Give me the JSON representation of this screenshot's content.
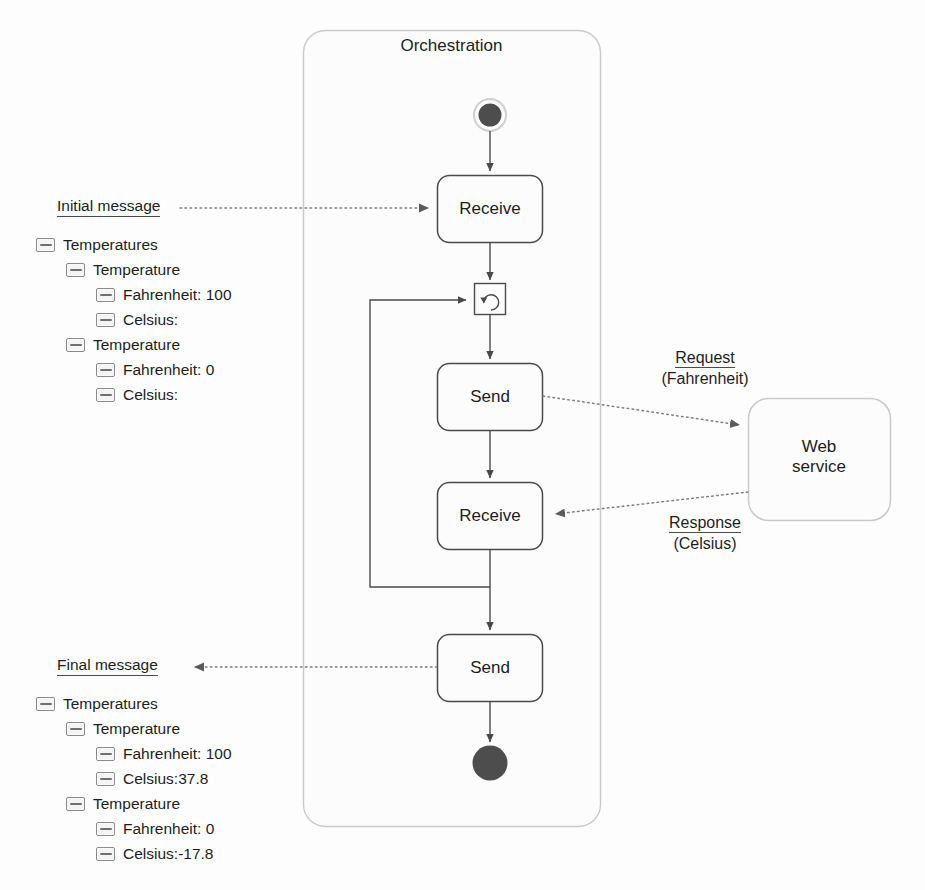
{
  "diagram": {
    "container": {
      "title": "Orchestration"
    },
    "nodes": {
      "start": {
        "name": "start-node",
        "label": ""
      },
      "receive_1": {
        "label": "Receive"
      },
      "loop": {
        "name": "loop-node",
        "label": ""
      },
      "send_1": {
        "label": "Send"
      },
      "receive_2": {
        "label": "Receive"
      },
      "send_2": {
        "label": "Send"
      },
      "end": {
        "name": "end-node",
        "label": ""
      },
      "web_service": {
        "label": "Web\nservice"
      }
    },
    "edge_labels": {
      "request": {
        "title": "Request",
        "subtitle": "(Fahrenheit)"
      },
      "response": {
        "title": "Response",
        "subtitle": "(Celsius)"
      }
    }
  },
  "initial_message": {
    "heading": "Initial message",
    "tree": [
      {
        "level": 0,
        "label": "Temperatures",
        "value": ""
      },
      {
        "level": 1,
        "label": "Temperature",
        "value": ""
      },
      {
        "level": 2,
        "label": "Fahrenheit: 100",
        "value": ""
      },
      {
        "level": 2,
        "label": "Celsius:",
        "value": ""
      },
      {
        "level": 1,
        "label": "Temperature",
        "value": ""
      },
      {
        "level": 2,
        "label": "Fahrenheit: 0",
        "value": ""
      },
      {
        "level": 2,
        "label": "Celsius:",
        "value": ""
      }
    ]
  },
  "final_message": {
    "heading": "Final message",
    "tree": [
      {
        "level": 0,
        "label": "Temperatures",
        "value": ""
      },
      {
        "level": 1,
        "label": "Temperature",
        "value": ""
      },
      {
        "level": 2,
        "label": "Fahrenheit: 100",
        "value": ""
      },
      {
        "level": 2,
        "label": "Celsius: ",
        "value": "37.8"
      },
      {
        "level": 1,
        "label": "Temperature",
        "value": ""
      },
      {
        "level": 2,
        "label": "Fahrenheit: 0",
        "value": ""
      },
      {
        "level": 2,
        "label": "Celsius: ",
        "value": "-17.8"
      }
    ]
  },
  "colors": {
    "stroke": "#4a4a4a",
    "container_stroke": "#c9c9c9",
    "node_fill": "#fcfcfc",
    "end_fill": "#4a4a4a",
    "dotted": "#7d7d7d",
    "text": "#1d1d1d"
  }
}
